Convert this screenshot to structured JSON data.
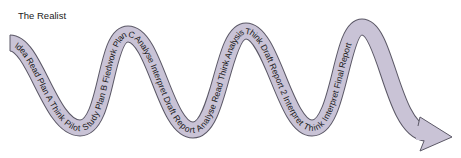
{
  "diagram": {
    "title": "The Realist",
    "arrow_text": "Idea Read Plan A Think Pilot Study Plan B Fiedwork Plan C Analyse Interpret Draft Report Analyse Read Think Analysis Think Draft Report 2 Interpret Think Interpret Final Report",
    "stages": [
      "Idea",
      "Read",
      "Plan A",
      "Think",
      "Pilot Study",
      "Plan B",
      "Fiedwork",
      "Plan C",
      "Analyse",
      "Interpret",
      "Draft Report",
      "Analyse",
      "Read",
      "Think",
      "Analysis",
      "Think",
      "Draft Report 2",
      "Interpret",
      "Think",
      "Interpret",
      "Final Report"
    ],
    "colors": {
      "arrow_fill": "#c9c3d6",
      "arrow_stroke": "#5b5866",
      "text": "#1a1a1a"
    }
  }
}
